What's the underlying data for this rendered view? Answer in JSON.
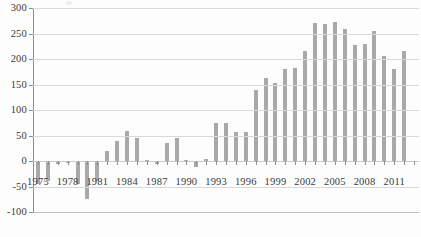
{
  "chart_data": {
    "type": "bar",
    "title": "",
    "subtitle": "",
    "xlabel": "",
    "ylabel": "",
    "ylim": [
      -100,
      300
    ],
    "ytick_step": 50,
    "yticks": [
      300,
      250,
      200,
      150,
      100,
      50,
      0,
      -50,
      -100
    ],
    "ytick_labels": [
      "300",
      "250",
      "200",
      "150",
      "100",
      "50",
      "0",
      "-50",
      "-100"
    ],
    "xlim": [
      1974.5,
      2013.5
    ],
    "xtick_labels": [
      "1975",
      "1978",
      "1981",
      "1984",
      "1987",
      "1990",
      "1993",
      "1996",
      "1999",
      "2002",
      "2005",
      "2008",
      "2011"
    ],
    "xtick_values": [
      1975,
      1978,
      1981,
      1984,
      1987,
      1990,
      1993,
      1996,
      1999,
      2002,
      2005,
      2008,
      2011
    ],
    "grid": true,
    "grid_axis": "y",
    "legend": "none",
    "bar_color": "#a9a9a9",
    "gridline_color": "#d9d9d9",
    "axis_color": "#8e8e8e",
    "background_color": "#fdfdfd",
    "categories": [
      1975,
      1976,
      1977,
      1978,
      1979,
      1980,
      1981,
      1982,
      1983,
      1984,
      1985,
      1986,
      1987,
      1988,
      1989,
      1990,
      1991,
      1992,
      1993,
      1994,
      1995,
      1996,
      1997,
      1998,
      1999,
      2000,
      2001,
      2002,
      2003,
      2004,
      2005,
      2006,
      2007,
      2008,
      2009,
      2010,
      2011,
      2012,
      2013
    ],
    "values": [
      -45,
      -40,
      -5,
      -3,
      -45,
      -75,
      -40,
      20,
      40,
      58,
      45,
      2,
      -5,
      35,
      45,
      2,
      -12,
      3,
      75,
      75,
      57,
      57,
      140,
      163,
      152,
      180,
      183,
      215,
      270,
      268,
      272,
      258,
      228,
      230,
      255,
      205,
      180,
      215,
      0
    ]
  }
}
